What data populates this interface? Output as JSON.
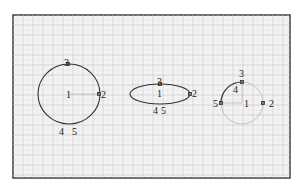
{
  "diagram": {
    "frame": {
      "x": 13,
      "y": 15,
      "width": 277,
      "height": 163
    },
    "grid": {
      "minor_step": 5,
      "major_step": 10
    },
    "colors": {
      "curve": "#333333",
      "faint_curve": "#bbbbbb",
      "background": "#f4f4f4",
      "frame": "#333333"
    },
    "shapes": [
      {
        "name": "full-circle",
        "type": "circle",
        "cx": 69,
        "cy": 94,
        "rx": 31,
        "ry": 30,
        "labels": [
          {
            "text": "1",
            "x": 66,
            "y": 98
          },
          {
            "text": "2",
            "x": 101,
            "y": 98
          },
          {
            "text": "3",
            "x": 64,
            "y": 66
          },
          {
            "text": "4",
            "x": 59,
            "y": 135
          },
          {
            "text": "5",
            "x": 72,
            "y": 135
          }
        ],
        "points": [
          {
            "id": "3",
            "x": 68,
            "y": 64
          },
          {
            "id": "2",
            "x": 99,
            "y": 94
          }
        ]
      },
      {
        "name": "flat-ellipse",
        "type": "ellipse",
        "cx": 160,
        "cy": 94,
        "rx": 30,
        "ry": 10,
        "labels": [
          {
            "text": "3",
            "x": 157,
            "y": 82
          },
          {
            "text": "1",
            "x": 157,
            "y": 97
          },
          {
            "text": "2",
            "x": 192,
            "y": 97
          },
          {
            "text": "4",
            "x": 153,
            "y": 113
          },
          {
            "text": "5",
            "x": 161,
            "y": 113
          }
        ],
        "points": [
          {
            "id": "3",
            "x": 160,
            "y": 84
          },
          {
            "id": "2",
            "x": 190,
            "y": 94
          }
        ]
      },
      {
        "name": "partial-arc",
        "type": "arc",
        "cx": 242,
        "cy": 103,
        "r": 21,
        "labels": [
          {
            "text": "3",
            "x": 239,
            "y": 77
          },
          {
            "text": "4",
            "x": 233,
            "y": 93
          },
          {
            "text": "1",
            "x": 244,
            "y": 107
          },
          {
            "text": "5",
            "x": 213,
            "y": 107
          },
          {
            "text": "2",
            "x": 269,
            "y": 107
          }
        ],
        "points": [
          {
            "id": "3",
            "x": 242,
            "y": 82
          },
          {
            "id": "5",
            "x": 221,
            "y": 103
          },
          {
            "id": "2",
            "x": 263,
            "y": 103
          }
        ]
      }
    ]
  }
}
